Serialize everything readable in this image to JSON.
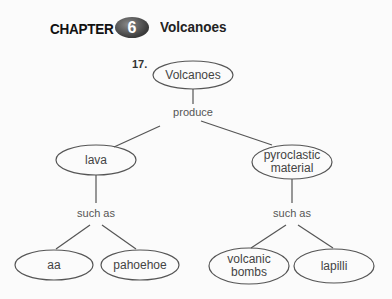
{
  "header": {
    "chapter_label": "CHAPTER",
    "chapter_number": "6",
    "chapter_title": "Volcanoes"
  },
  "question_number": "17.",
  "concept_map": {
    "root": {
      "label": "Volcanoes"
    },
    "root_link": "produce",
    "branches": [
      {
        "label": "lava",
        "link": "such as",
        "children": [
          {
            "label": "aa"
          },
          {
            "label": "pahoehoe"
          }
        ]
      },
      {
        "label": "pyroclastic material",
        "label_lines": [
          "pyroclastic",
          "material"
        ],
        "link": "such as",
        "children": [
          {
            "label": "volcanic bombs",
            "label_lines": [
              "volcanic",
              "bombs"
            ]
          },
          {
            "label": "lapilli"
          }
        ]
      }
    ]
  },
  "colors": {
    "line": "#555555",
    "text": "#444444",
    "background": "#fbfbfb"
  }
}
